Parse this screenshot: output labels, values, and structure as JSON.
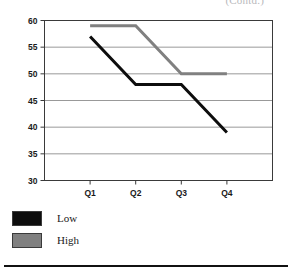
{
  "caption_fragment": "(Contd.)",
  "chart_data": {
    "type": "line",
    "title": "",
    "subtitle": "",
    "xlabel": "",
    "ylabel": "",
    "categories": [
      "Q1",
      "Q2",
      "Q3",
      "Q4"
    ],
    "series": [
      {
        "name": "Low",
        "color": "#0d0d0d",
        "values": [
          57,
          48,
          48,
          39
        ]
      },
      {
        "name": "High",
        "color": "#808080",
        "values": [
          59,
          59,
          50,
          50
        ]
      }
    ],
    "ylim": [
      30,
      60
    ],
    "yticks": [
      30,
      35,
      40,
      45,
      50,
      55,
      60
    ],
    "ytick_labels": [
      "30",
      "35",
      "40",
      "45",
      "50",
      "55",
      "60"
    ],
    "xtick_labels": [
      "Q1",
      "Q2",
      "Q3",
      "Q4"
    ],
    "grid": "horizontal",
    "grid_color": "#999999",
    "frame": true,
    "legend_position": "below-left",
    "legend_entries": [
      {
        "label": "Low",
        "color": "#0d0d0d"
      },
      {
        "label": "High",
        "color": "#808080"
      }
    ]
  },
  "axis": {
    "y_labels": [
      "60",
      "55",
      "50",
      "45",
      "40",
      "35",
      "30"
    ],
    "x_labels": [
      "Q1",
      "Q2",
      "Q3",
      "Q4"
    ]
  },
  "legend": {
    "rows": [
      {
        "label": "Low"
      },
      {
        "label": "High"
      }
    ]
  }
}
